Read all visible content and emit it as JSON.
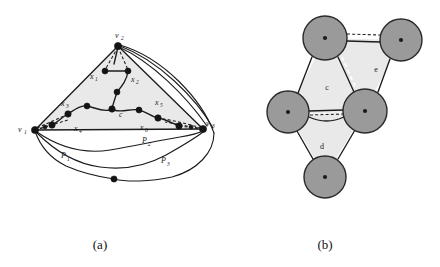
{
  "figure": {
    "background_color": "#ffffff",
    "ink_color": "#1c1c1c",
    "region_fill_color": "#e9e9e9",
    "blob_fill_color": "#9a9a9a",
    "panels": [
      {
        "id": "a",
        "caption": "(a)"
      },
      {
        "id": "b",
        "caption": "(b)"
      }
    ]
  },
  "panel_a": {
    "caption": "(a)",
    "vertices": [
      {
        "name": "v-top",
        "label": "v",
        "subscript": "2",
        "x": 118,
        "y": 44
      },
      {
        "name": "v-left",
        "label": "v",
        "subscript": "1",
        "x": 33,
        "y": 130
      },
      {
        "name": "v-right",
        "label": "v",
        "subscript": "3",
        "x": 204,
        "y": 129
      }
    ],
    "center_node": {
      "label": "c",
      "x": 112,
      "y": 110
    },
    "x_labels": [
      {
        "label": "x",
        "subscript": "1",
        "x": 95,
        "y": 76
      },
      {
        "label": "x",
        "subscript": "2",
        "x": 126,
        "y": 79
      },
      {
        "label": "x",
        "subscript": "3",
        "x": 66,
        "y": 105
      },
      {
        "label": "x",
        "subscript": "4",
        "x": 80,
        "y": 125
      },
      {
        "label": "x",
        "subscript": "5",
        "x": 157,
        "y": 105
      },
      {
        "label": "x",
        "subscript": "6",
        "x": 145,
        "y": 125
      }
    ],
    "path_labels": [
      {
        "label": "P",
        "subscript": "1",
        "x": 65,
        "y": 157
      },
      {
        "label": "P",
        "subscript": "2",
        "x": 146,
        "y": 142
      },
      {
        "label": "P",
        "subscript": "3",
        "x": 165,
        "y": 162
      }
    ]
  },
  "panel_b": {
    "caption": "(b)",
    "blobs": [
      {
        "name": "blob-top-left",
        "cx": 325,
        "cy": 38,
        "r": 22
      },
      {
        "name": "blob-top-right",
        "cx": 401,
        "cy": 40,
        "r": 21
      },
      {
        "name": "blob-mid-left",
        "cx": 288,
        "cy": 112,
        "r": 21
      },
      {
        "name": "blob-mid-right",
        "cx": 365,
        "cy": 111,
        "r": 22
      },
      {
        "name": "blob-bottom",
        "cx": 325,
        "cy": 177,
        "r": 21
      }
    ],
    "face_labels": [
      {
        "label": "c",
        "x": 327,
        "y": 88
      },
      {
        "label": "d",
        "x": 322,
        "y": 146
      },
      {
        "label": "e",
        "x": 375,
        "y": 70
      }
    ]
  }
}
